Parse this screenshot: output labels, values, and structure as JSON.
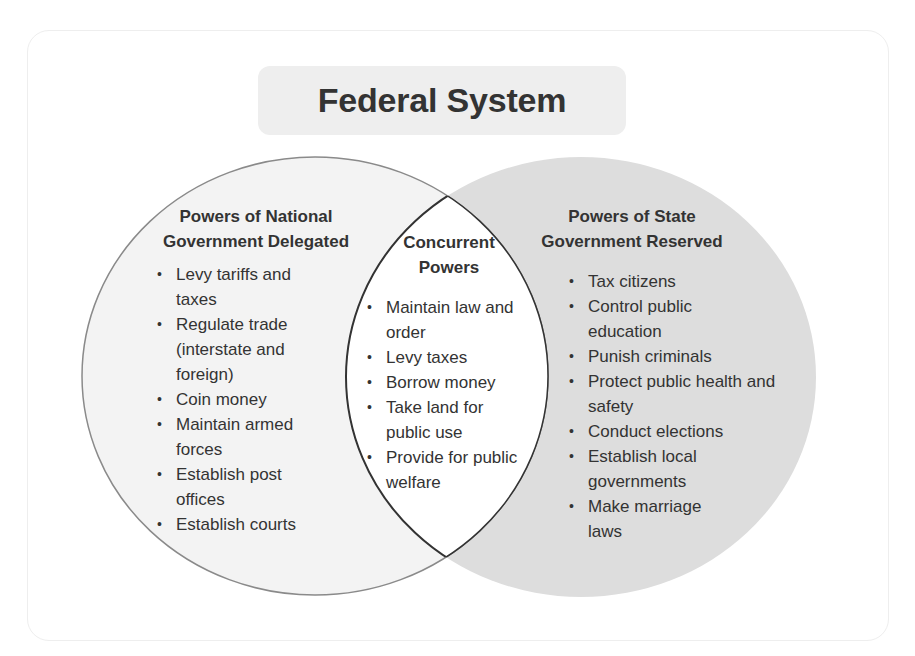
{
  "title": "Federal System",
  "colors": {
    "left_fill": "#f3f3f3",
    "left_stroke": "#8a8a8a",
    "right_fill": "#dddddd",
    "intersection_fill": "#ffffff",
    "intersection_stroke": "#333333",
    "title_bg": "#eeeeee",
    "text": "#333333"
  },
  "left": {
    "heading_line1": "Powers of National",
    "heading_line2": "Government Delegated",
    "items": [
      "Levy tariffs and taxes",
      "Regulate trade (interstate and foreign)",
      "Coin money",
      "Maintain armed forces",
      "Establish post offices",
      "Establish courts"
    ]
  },
  "center": {
    "heading_line1": "Concurrent",
    "heading_line2": "Powers",
    "items": [
      "Maintain law and order",
      "Levy taxes",
      "Borrow money",
      "Take land for public use",
      "Provide for public welfare"
    ]
  },
  "right": {
    "heading_line1": "Powers of State",
    "heading_line2": "Government Reserved",
    "items": [
      "Tax citizens",
      "Control public education",
      "Punish criminals",
      "Protect public health and safety",
      "Conduct elections",
      "Establish local governments",
      "Make marriage laws"
    ]
  },
  "bullet": "•"
}
